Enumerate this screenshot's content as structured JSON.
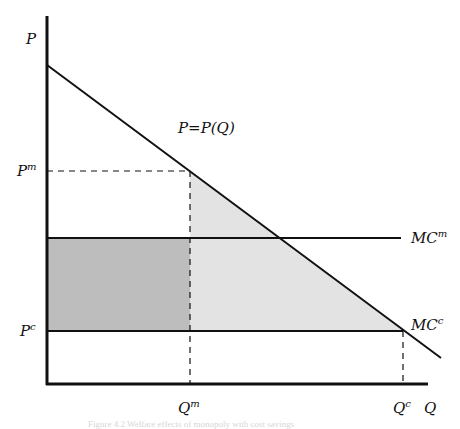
{
  "diagram": {
    "type": "monopoly-vs-competition welfare diagram",
    "axes": {
      "y_label": "P",
      "x_label": "Q"
    },
    "curves": {
      "demand_label": "P=P(Q)",
      "mc_monopoly": {
        "base": "MC",
        "sup": "m"
      },
      "mc_competitive": {
        "base": "MC",
        "sup": "c"
      }
    },
    "ticks": {
      "p_monopoly": {
        "base": "P",
        "sup": "m"
      },
      "p_competitive": {
        "base": "P",
        "sup": "c"
      },
      "q_monopoly": {
        "base": "Q",
        "sup": "m"
      },
      "q_competitive": {
        "base": "Q",
        "sup": "c"
      }
    },
    "regions": {
      "cost_saving_rectangle_color": "#bdbdbd",
      "deadweight_triangle_color": "#e3e3e3"
    },
    "caption": "Figure 4.2 Welfare effects of monopoly with cost savings"
  }
}
